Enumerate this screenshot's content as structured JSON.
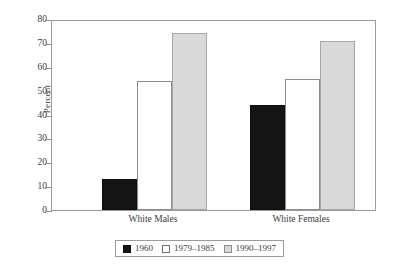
{
  "chart_data": {
    "type": "bar",
    "title": "",
    "xlabel": "",
    "ylabel": "Percent",
    "ylim": [
      0,
      80
    ],
    "yticks": [
      0,
      10,
      20,
      30,
      40,
      50,
      60,
      70,
      80
    ],
    "ytick_labels": [
      "0",
      "10",
      "20",
      "30",
      "40",
      "50",
      "60",
      "70",
      "80"
    ],
    "grid": false,
    "legend_position": "bottom",
    "categories": [
      "White Males",
      "White Females"
    ],
    "series": [
      {
        "name": "1960",
        "values": [
          13,
          44
        ],
        "color": "#141414",
        "swatch": "black"
      },
      {
        "name": "1979–1985",
        "values": [
          54,
          55
        ],
        "color": "#ffffff",
        "swatch": "white"
      },
      {
        "name": "1990–1997",
        "values": [
          74,
          71
        ],
        "color": "#d9d9d9",
        "swatch": "gray"
      }
    ]
  },
  "axis": {
    "y_label": "Percent"
  },
  "legend": {
    "items": [
      {
        "label": "1960",
        "swatch": "black"
      },
      {
        "label": "1979–1985",
        "swatch": "white"
      },
      {
        "label": "1990–1997",
        "swatch": "gray"
      }
    ]
  }
}
